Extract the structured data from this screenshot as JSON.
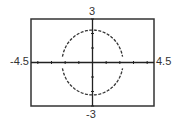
{
  "chart_data": {
    "type": "line",
    "title": "",
    "xlabel": "",
    "ylabel": "",
    "xlim": [
      -4.5,
      4.5
    ],
    "ylim": [
      -3,
      3
    ],
    "x_tick_step": 1,
    "y_tick_step": 1,
    "grid": false,
    "legend": null,
    "window_labels": {
      "xmin": "-4.5",
      "xmax": "4.5",
      "ymin": "-3",
      "ymax": "3"
    },
    "series": [
      {
        "name": "upper semicircle",
        "equation": "y = sqrt(5 - x^2)",
        "style": "dashed",
        "x": [
          -2.2,
          -2.0,
          -1.5,
          -1.0,
          -0.5,
          0,
          0.5,
          1.0,
          1.5,
          2.0,
          2.2
        ],
        "y": [
          0.4,
          1.0,
          1.66,
          2.0,
          2.18,
          2.24,
          2.18,
          2.0,
          1.66,
          1.0,
          0.4
        ]
      },
      {
        "name": "lower semicircle",
        "equation": "y = -sqrt(5 - x^2)",
        "style": "dashed",
        "x": [
          -2.2,
          -2.0,
          -1.5,
          -1.0,
          -0.5,
          0,
          0.5,
          1.0,
          1.5,
          2.0,
          2.2
        ],
        "y": [
          -0.4,
          -1.0,
          -1.66,
          -2.0,
          -2.18,
          -2.24,
          -2.18,
          -2.0,
          -1.66,
          -1.0,
          -0.4
        ]
      }
    ],
    "colors": {
      "frame": "#333333",
      "axes": "#222222",
      "curve": "#333333"
    }
  }
}
